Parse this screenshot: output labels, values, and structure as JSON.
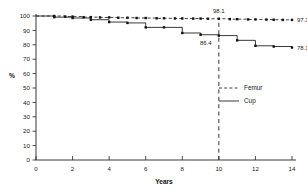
{
  "chart_data": {
    "type": "line",
    "title": "",
    "subtitle": "",
    "xlabel": "Years",
    "ylabel": "%",
    "xlim": [
      0,
      14
    ],
    "ylim": [
      0,
      100
    ],
    "grid": false,
    "legend_position": "middle-right",
    "x_ticks": [
      0,
      2,
      4,
      6,
      8,
      10,
      12,
      14
    ],
    "x_tick_labels": [
      "0",
      "2",
      "4",
      "6",
      "8",
      "10",
      "12",
      "14"
    ],
    "y_ticks": [
      0,
      10,
      20,
      30,
      40,
      50,
      60,
      70,
      80,
      90,
      100
    ],
    "y_tick_labels": [
      "0",
      "10",
      "20",
      "30",
      "40",
      "50",
      "60",
      "70",
      "80",
      "90",
      "100"
    ],
    "series": [
      {
        "name": "Femur",
        "style": "dashed",
        "marker": "square",
        "x": [
          0,
          1,
          1.6,
          2,
          2.6,
          3,
          3.5,
          4,
          4.5,
          5,
          5.5,
          6,
          6.6,
          7,
          7.6,
          8,
          8.6,
          9,
          9.4,
          10,
          10.6,
          11,
          11.6,
          12,
          12.6,
          13,
          13.5,
          14
        ],
        "values": [
          100,
          100,
          99.6,
          99.6,
          99.2,
          99.2,
          99.0,
          99.0,
          98.8,
          98.8,
          98.6,
          98.6,
          98.4,
          98.4,
          98.3,
          98.3,
          98.2,
          98.2,
          98.1,
          98.1,
          97.8,
          97.8,
          97.6,
          97.6,
          97.5,
          97.4,
          97.3,
          97.3
        ]
      },
      {
        "name": "Cup",
        "style": "solid",
        "marker": "square",
        "x": [
          0,
          1,
          2,
          3,
          4,
          5,
          6,
          7,
          8,
          9,
          10,
          11,
          12,
          13,
          14
        ],
        "values": [
          100,
          99.2,
          98.6,
          97.4,
          95.8,
          95.2,
          92.1,
          92.1,
          88.2,
          87.0,
          86.4,
          83.1,
          79.3,
          78.8,
          78.1
        ]
      }
    ],
    "annotations": [
      {
        "text": "98.1",
        "x": 10,
        "y": 98.1,
        "position": "above"
      },
      {
        "text": "86.4",
        "x": 9.4,
        "y": 86.4,
        "position": "below-left"
      },
      {
        "text": "97.3",
        "x": 14,
        "y": 97.3,
        "position": "right"
      },
      {
        "text": "78.1",
        "x": 14,
        "y": 78.1,
        "position": "right"
      }
    ],
    "reference_lines": [
      {
        "orientation": "vertical",
        "x": 10,
        "style": "dashed",
        "from_y": 0,
        "to_y": 98.1
      }
    ]
  },
  "legend": {
    "entries": [
      {
        "label": "Femur",
        "style": "dashed"
      },
      {
        "label": "Cup",
        "style": "solid"
      }
    ]
  }
}
